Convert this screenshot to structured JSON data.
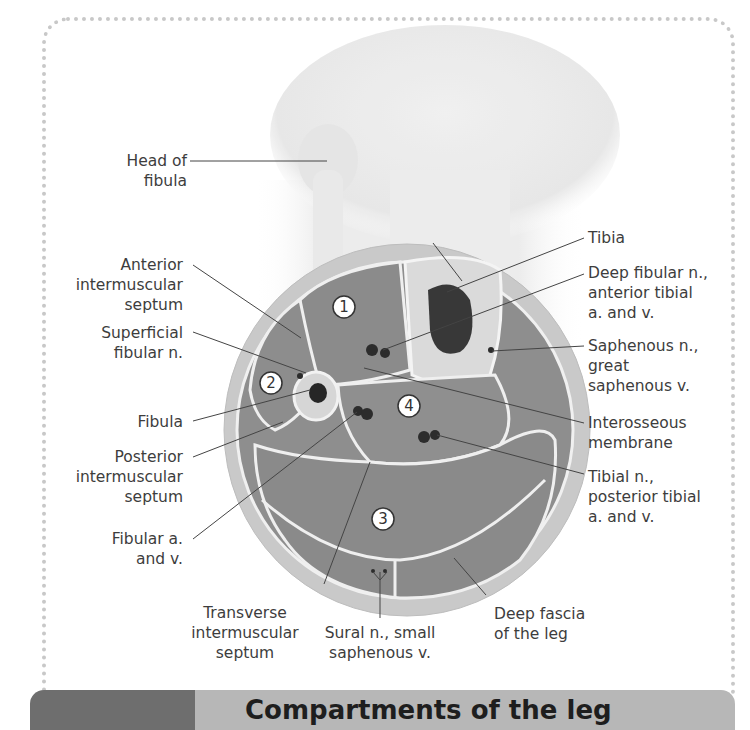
{
  "figure": {
    "title": "Compartments of the leg",
    "colors": {
      "frame_dots": "#c8c8c8",
      "bar_dark": "#6e6e6e",
      "bar_light": "#b7b7b7",
      "muscle": "#8e8e8e",
      "fat": "#c9c9c9",
      "bone": "#d9d9d9",
      "marrow": "#2a2a2a",
      "label_text": "#3d3d3d",
      "leader_line": "#444444"
    }
  },
  "labels_left": [
    {
      "id": "head-of-fibula",
      "lines": [
        "Head of",
        "fibula"
      ]
    },
    {
      "id": "anterior-intermuscular-septum",
      "lines": [
        "Anterior",
        "intermuscular",
        "septum"
      ]
    },
    {
      "id": "superficial-fibular-n",
      "lines": [
        "Superficial",
        "fibular n."
      ]
    },
    {
      "id": "fibula",
      "lines": [
        "Fibula"
      ]
    },
    {
      "id": "posterior-intermuscular-septum",
      "lines": [
        "Posterior",
        "intermuscular",
        "septum"
      ]
    },
    {
      "id": "fibular-a-and-v",
      "lines": [
        "Fibular a.",
        "and v."
      ]
    }
  ],
  "labels_right": [
    {
      "id": "tibia",
      "lines": [
        "Tibia"
      ]
    },
    {
      "id": "deep-fibular-n",
      "lines": [
        "Deep fibular n.,",
        "anterior tibial",
        "a. and v."
      ]
    },
    {
      "id": "saphenous-n",
      "lines": [
        "Saphenous n.,",
        "great",
        "saphenous v."
      ]
    },
    {
      "id": "interosseous-membrane",
      "lines": [
        "Interosseous",
        "membrane"
      ]
    },
    {
      "id": "tibial-n",
      "lines": [
        "Tibial n.,",
        "posterior tibial",
        "a. and v."
      ]
    }
  ],
  "labels_bottom": [
    {
      "id": "transverse-intermuscular-septum",
      "lines": [
        "Transverse",
        "intermuscular",
        "septum"
      ]
    },
    {
      "id": "sural-n",
      "lines": [
        "Sural n., small",
        "saphenous v."
      ]
    },
    {
      "id": "deep-fascia",
      "lines": [
        "Deep fascia",
        "of the leg"
      ]
    }
  ],
  "compartment_markers": [
    "1",
    "2",
    "3",
    "4"
  ]
}
